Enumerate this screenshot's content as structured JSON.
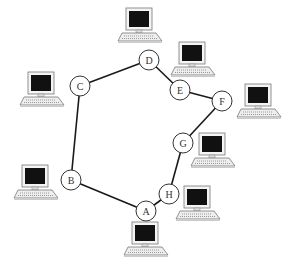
{
  "diagram": {
    "title": "",
    "topology": "ring",
    "nodes": [
      {
        "id": "A",
        "label": "A"
      },
      {
        "id": "B",
        "label": "B"
      },
      {
        "id": "C",
        "label": "C"
      },
      {
        "id": "D",
        "label": "D"
      },
      {
        "id": "E",
        "label": "E"
      },
      {
        "id": "F",
        "label": "F"
      },
      {
        "id": "G",
        "label": "G"
      },
      {
        "id": "H",
        "label": "H"
      }
    ],
    "links": [
      [
        "A",
        "B"
      ],
      [
        "B",
        "C"
      ],
      [
        "C",
        "D"
      ],
      [
        "D",
        "E"
      ],
      [
        "E",
        "F"
      ],
      [
        "F",
        "G"
      ],
      [
        "G",
        "H"
      ],
      [
        "H",
        "A"
      ]
    ],
    "computers": [
      {
        "icon": "desktop-computer-icon",
        "near": "D"
      },
      {
        "icon": "desktop-computer-icon",
        "near": "C"
      },
      {
        "icon": "desktop-computer-icon",
        "near": "E"
      },
      {
        "icon": "desktop-computer-icon",
        "near": "F"
      },
      {
        "icon": "desktop-computer-icon",
        "near": "G"
      },
      {
        "icon": "desktop-computer-icon",
        "near": "B"
      },
      {
        "icon": "desktop-computer-icon",
        "near": "H"
      },
      {
        "icon": "desktop-computer-icon",
        "near": "A"
      }
    ],
    "colors": {
      "line": "#1a1a1a",
      "screen": "#111111",
      "body": "#f2f2f2"
    }
  }
}
